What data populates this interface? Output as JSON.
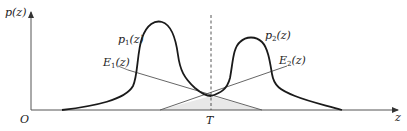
{
  "figure": {
    "type": "two-class probability density diagram with decision threshold",
    "axes": {
      "y_label": "p(z)",
      "x_label": "z",
      "origin_label": "O"
    },
    "threshold": {
      "label": "T",
      "style": "dashed vertical line"
    },
    "curves": [
      {
        "id": "p1",
        "label_base": "p",
        "label_sub": "1",
        "label_arg": "(z)",
        "description": "left density peak"
      },
      {
        "id": "p2",
        "label_base": "p",
        "label_sub": "2",
        "label_arg": "(z)",
        "description": "right density peak"
      }
    ],
    "error_lines": [
      {
        "id": "E1",
        "label_base": "E",
        "label_sub": "1",
        "label_arg": "(z)",
        "description": "decreasing line through threshold intersection"
      },
      {
        "id": "E2",
        "label_base": "E",
        "label_sub": "2",
        "label_arg": "(z)",
        "description": "increasing line through threshold intersection"
      }
    ],
    "shaded_region": "overlap error area below intersection at T",
    "colors": {
      "curve": "#1a1a1a",
      "line": "#555555",
      "axis": "#444444",
      "shade": "#e6e6e6"
    }
  }
}
